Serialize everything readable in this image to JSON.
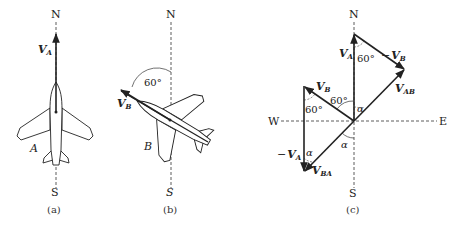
{
  "figure": {
    "panels": [
      {
        "id": "a",
        "caption": "(a)",
        "compass": {
          "north": "N",
          "south": "S"
        },
        "aircraft_label": "A",
        "vector": {
          "name": "V",
          "subscript": "A",
          "direction": "north"
        }
      },
      {
        "id": "b",
        "caption": "(b)",
        "compass": {
          "north": "N",
          "south": "S"
        },
        "aircraft_label": "B",
        "vector": {
          "name": "V",
          "subscript": "B",
          "direction": "60° west of north"
        },
        "angle_label": "60°"
      },
      {
        "id": "c",
        "caption": "(c)",
        "compass": {
          "north": "N",
          "south": "S",
          "west": "W",
          "east": "E"
        },
        "vectors": [
          {
            "name": "V",
            "subscript": "A",
            "prefix": ""
          },
          {
            "name": "V",
            "subscript": "B",
            "prefix": "−"
          },
          {
            "name": "V",
            "subscript": "AB",
            "prefix": ""
          },
          {
            "name": "V",
            "subscript": "B",
            "prefix": ""
          },
          {
            "name": "V",
            "subscript": "A",
            "prefix": "−"
          },
          {
            "name": "V",
            "subscript": "BA",
            "prefix": ""
          }
        ],
        "angle_labels": [
          "60°",
          "60°",
          "60°",
          "α",
          "α",
          "α"
        ]
      }
    ]
  }
}
